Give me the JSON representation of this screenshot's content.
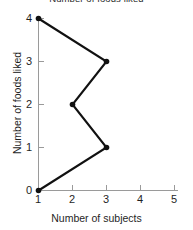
{
  "chart_data": {
    "type": "line",
    "title": "Number of foods liked",
    "title_clipped": true,
    "xlabel": "Number of subjects",
    "ylabel": "Number of foods liked",
    "xlim": [
      1,
      5
    ],
    "ylim": [
      0,
      4
    ],
    "xticks": [
      1,
      2,
      3,
      4,
      5
    ],
    "yticks": [
      0,
      1,
      2,
      3,
      4
    ],
    "xtick_labels": [
      "1",
      "2",
      "3",
      "4",
      "5"
    ],
    "ytick_labels": [
      "0",
      "1",
      "2",
      "3",
      "4"
    ],
    "grid": false,
    "legend": null,
    "marker": "filled-circle",
    "line_color": "#111111",
    "axis_color": "#9a9a9a",
    "background_color": "#ffffff",
    "points": [
      {
        "x": 1,
        "y": 4
      },
      {
        "x": 3,
        "y": 3
      },
      {
        "x": 2,
        "y": 2
      },
      {
        "x": 3,
        "y": 1
      },
      {
        "x": 1,
        "y": 0
      }
    ],
    "x": [
      1,
      3,
      2,
      3,
      1
    ],
    "values": [
      4,
      3,
      2,
      1,
      0
    ]
  }
}
